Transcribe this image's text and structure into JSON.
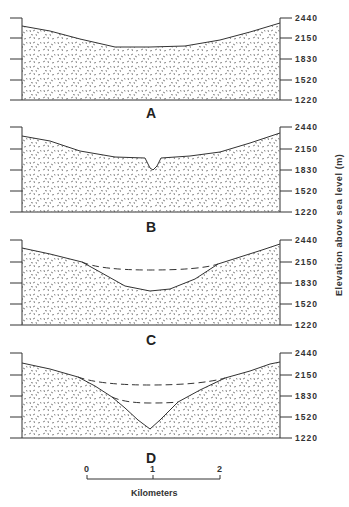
{
  "figure": {
    "panels": [
      {
        "label": "A",
        "description": "Gentle broad valley profile"
      },
      {
        "label": "B",
        "description": "Broad valley with small V-notch incision at center"
      },
      {
        "label": "C",
        "description": "Deepened U-shaped valley with former surface shown dashed"
      },
      {
        "label": "D",
        "description": "Deep V-shaped canyon with two former surfaces shown dashed"
      }
    ],
    "y_axis": {
      "title": "Elevation above sea level (m)",
      "ticks": [
        "2440",
        "2150",
        "1830",
        "1520",
        "1220"
      ]
    },
    "scale_bar": {
      "ticks": [
        "0",
        "1",
        "2"
      ],
      "unit": "Kilometers"
    },
    "colors": {
      "line": "#333333",
      "background": "#ffffff",
      "fill_stipple": "#555555"
    }
  }
}
